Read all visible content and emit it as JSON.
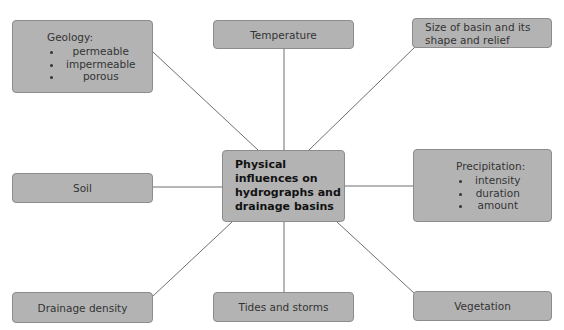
{
  "diagram": {
    "center": {
      "label": "Physical influences on hydrographs and drainage basins"
    },
    "nodes": {
      "geology": {
        "heading": "Geology:",
        "items": [
          "permeable",
          "impermeable",
          "porous"
        ]
      },
      "temperature": {
        "label": "Temperature"
      },
      "size": {
        "label": "Size of basin and its shape and relief"
      },
      "soil": {
        "label": "Soil"
      },
      "precipitation": {
        "heading": "Precipitation:",
        "items": [
          "intensity",
          "duration",
          "amount"
        ]
      },
      "drainage_density": {
        "label": "Drainage density"
      },
      "tides": {
        "label": "Tides and storms"
      },
      "vegetation": {
        "label": "Vegetation"
      }
    },
    "colors": {
      "box_fill": "#b3b3b3",
      "box_border": "#8c8c8c",
      "connector": "#6f6f6f"
    }
  }
}
